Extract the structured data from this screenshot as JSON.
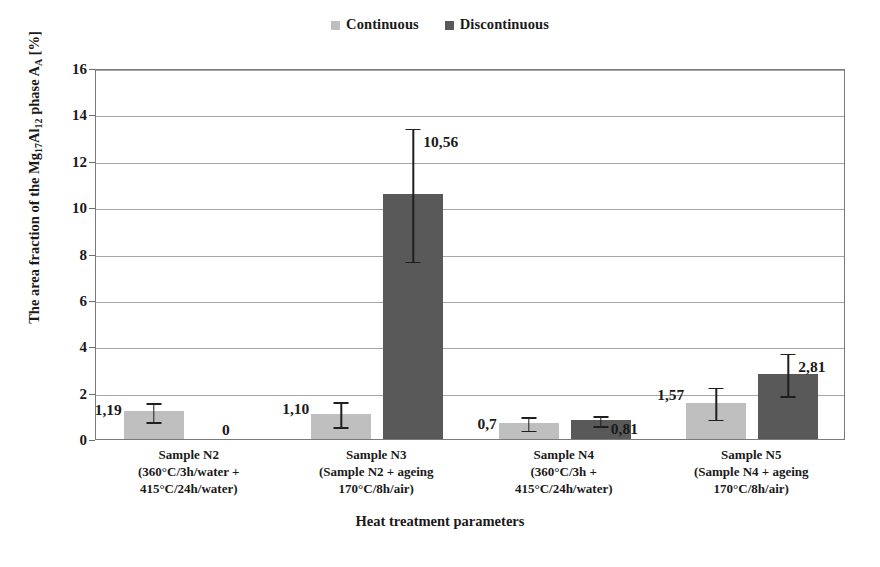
{
  "chart_data": {
    "type": "bar",
    "title": "",
    "xlabel": "Heat treatment parameters",
    "ylabel": "The area fraction of the Mg17Al12 phase AA [%]",
    "ylabel_parts": {
      "prefix": "The area fraction of the Mg",
      "sub1": "17",
      "mid": "Al",
      "sub2": "12",
      "suffix": " phase A",
      "sub3": "A",
      "units": " [%]"
    },
    "ylim": [
      0,
      16
    ],
    "yticks": [
      0,
      2,
      4,
      6,
      8,
      10,
      12,
      14,
      16
    ],
    "ytick_labels": [
      "0",
      "2",
      "4",
      "6",
      "8",
      "10",
      "12",
      "14",
      "16"
    ],
    "grid": "horizontal",
    "legend_position": "top-center",
    "decimal_separator": ",",
    "categories": [
      "Sample N2 (360°C/3h/water + 415°C/24h/water)",
      "Sample N3 (Sample N2 + ageing 170°C/8h/air)",
      "Sample N4 (360°C/3h + 415°C/24h/water)",
      "Sample N5 (Sample N4 + ageing 170°C/8h/air)"
    ],
    "category_lines": [
      [
        "Sample N2",
        "(360°C/3h/water +",
        "415°C/24h/water)"
      ],
      [
        "Sample N3",
        "(Sample N2 + ageing",
        "170°C/8h/air)"
      ],
      [
        "Sample N4",
        "(360°C/3h +",
        "415°C/24h/water)"
      ],
      [
        "Sample N5",
        "(Sample N4 + ageing",
        "170°C/8h/air)"
      ]
    ],
    "series": [
      {
        "name": "Continuous",
        "color": "#bfbfbf",
        "values": [
          1.19,
          1.1,
          0.7,
          1.57
        ],
        "value_labels": [
          "1,19",
          "1,10",
          "0,7",
          "1,57"
        ],
        "errors": [
          0.45,
          0.58,
          0.33,
          0.72
        ],
        "error_low": [
          0.74,
          0.52,
          0.37,
          0.85
        ],
        "error_high": [
          1.64,
          1.68,
          1.03,
          2.29
        ]
      },
      {
        "name": "Discontinuous",
        "color": "#595959",
        "values": [
          0,
          10.56,
          0.81,
          2.81
        ],
        "value_labels": [
          "0",
          "10,56",
          "0,81",
          "2,81"
        ],
        "errors": [
          0,
          2.9,
          0.25,
          0.95
        ],
        "error_low": [
          0,
          7.66,
          0.56,
          1.86
        ],
        "error_high": [
          0,
          13.46,
          1.06,
          3.76
        ]
      }
    ]
  },
  "legend": {
    "entries": [
      {
        "label": "Continuous",
        "color": "#bfbfbf"
      },
      {
        "label": "Discontinuous",
        "color": "#595959"
      }
    ]
  },
  "axes": {
    "y_title": "The area fraction of the Mg17Al12 phase AA [%]",
    "x_title": "Heat treatment parameters"
  },
  "colors": {
    "continuous": "#bfbfbf",
    "discontinuous": "#595959",
    "grid": "#a6a6a6",
    "frame": "#7a7a7a",
    "error": "#1f1f1f",
    "text": "#1a1a1a",
    "background": "#ffffff"
  }
}
